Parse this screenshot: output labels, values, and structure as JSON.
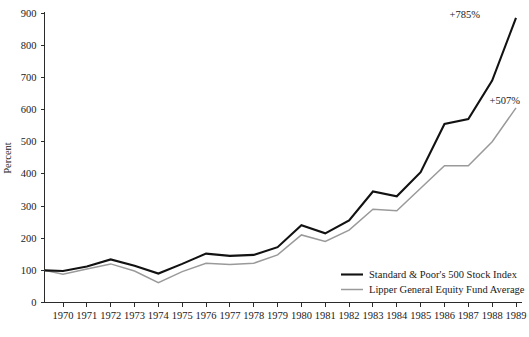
{
  "chart_data": {
    "type": "line",
    "title": "",
    "xlabel": "",
    "ylabel": "Percent",
    "ylim": [
      0,
      900
    ],
    "ytick_step": 100,
    "yticks": [
      "0",
      "100",
      "200",
      "300",
      "400",
      "500",
      "600",
      "700",
      "800",
      "900"
    ],
    "categories": [
      "1969",
      "1970",
      "1971",
      "1972",
      "1973",
      "1974",
      "1975",
      "1976",
      "1977",
      "1978",
      "1979",
      "1980",
      "1981",
      "1982",
      "1983",
      "1984",
      "1985",
      "1986",
      "1987",
      "1988",
      "1989"
    ],
    "xtick_labels": [
      "1970",
      "1971",
      "1972",
      "1973",
      "1974",
      "1975",
      "1976",
      "1977",
      "1978",
      "1979",
      "1980",
      "1981",
      "1982",
      "1983",
      "1984",
      "1985",
      "1986",
      "1987",
      "1988",
      "1989"
    ],
    "grid": false,
    "legend_position": "bottom-right",
    "series": [
      {
        "name": "Standard & Poor's 500 Stock Index",
        "color": "#121212",
        "width": 2.1,
        "values": [
          100,
          98,
          112,
          134,
          114,
          90,
          120,
          152,
          145,
          148,
          172,
          240,
          215,
          255,
          345,
          330,
          405,
          555,
          570,
          690,
          885
        ]
      },
      {
        "name": "Lipper General Equity Fund Average",
        "color": "#9a9a9a",
        "width": 1.5,
        "values": [
          100,
          88,
          104,
          120,
          98,
          62,
          96,
          122,
          118,
          122,
          148,
          210,
          190,
          225,
          290,
          285,
          355,
          425,
          425,
          500,
          605
        ]
      }
    ],
    "annotations": [
      {
        "text": "+785%",
        "series": "Standard & Poor's 500 Stock Index",
        "x": 480,
        "y": 18
      },
      {
        "text": "+507%",
        "series": "Lipper General Equity Fund Average",
        "x": 520,
        "y": 104
      }
    ]
  },
  "legend": {
    "entries": [
      {
        "label": "Standard & Poor's 500 Stock Index"
      },
      {
        "label": "Lipper General Equity Fund Average"
      }
    ]
  }
}
